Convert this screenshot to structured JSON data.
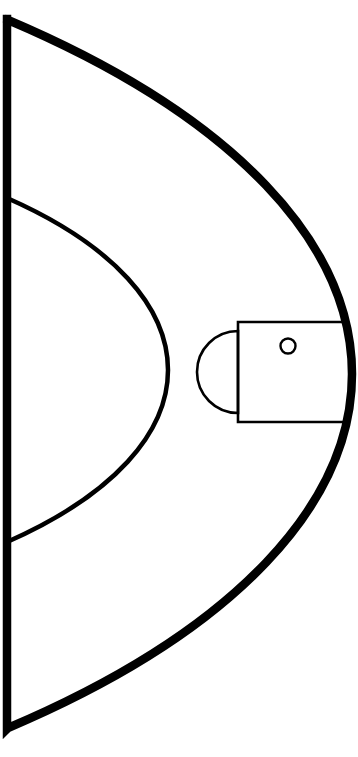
{
  "diagram": {
    "canvas": {
      "width": 358,
      "height": 757,
      "background": "#ffffff"
    },
    "stroke_color": "#000000",
    "elements": {
      "baseline": {
        "name": "baseline",
        "label": "Baseline (end line)",
        "x": 7,
        "y_top": 19,
        "y_bottom": 729,
        "stroke_width": 8.5
      },
      "court_boundary_arc": {
        "name": "court-boundary-arc",
        "label": "Outer court boundary arc",
        "start_x": 8,
        "start_y": 20,
        "end_x": 8,
        "end_y": 728,
        "apex_x": 352,
        "apex_y": 374,
        "stroke_width": 8.5
      },
      "three_point_arc": {
        "name": "three-point-arc",
        "label": "Three-point arc",
        "start_x": 7,
        "start_y": 198,
        "end_x": 7,
        "end_y": 542,
        "apex_x": 168,
        "apex_y": 370,
        "stroke_width": 4.5
      },
      "key": {
        "name": "key-rectangle",
        "label": "Key / paint lane",
        "x": 238,
        "y": 322,
        "width": 107,
        "height": 100,
        "stroke_width": 2.6
      },
      "free_throw_semicircle": {
        "name": "free-throw-semicircle",
        "label": "Free-throw semicircle",
        "center_x": 238,
        "center_y": 372,
        "radius": 41,
        "stroke_width": 2.6
      },
      "hoop": {
        "name": "hoop-circle",
        "label": "Hoop / basket",
        "center_x": 288,
        "center_y": 346,
        "radius": 7.5,
        "stroke_width": 2.4
      }
    }
  }
}
